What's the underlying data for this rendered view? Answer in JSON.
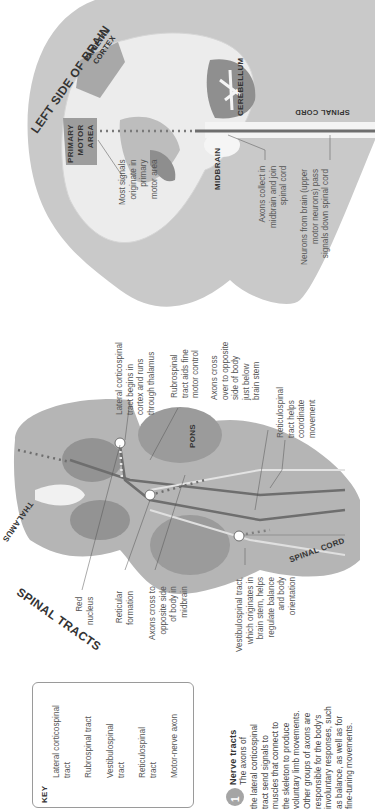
{
  "brain_view": {
    "title": "LEFT SIDE OF BRAIN",
    "regions": {
      "primary_motor_area": [
        "PRIMARY",
        "MOTOR",
        "AREA"
      ],
      "parietal_cortex": [
        "PARIETAL",
        "CORTEX"
      ],
      "cerebellum": "CEREBELLUM",
      "midbrain": "MIDBRAIN",
      "spinal_cord": "SPINAL CORD"
    },
    "annotations": {
      "most_signals": [
        "Most signals",
        "originate in",
        "primary",
        "motor area"
      ],
      "axons_collect": [
        "Axons collect in",
        "midbrain and join",
        "spinal cord"
      ],
      "neurons_from_brain": [
        "Neurons from brain (upper",
        "motor neurons) pass",
        "signals down spinal cord"
      ]
    }
  },
  "spinal_tracts_view": {
    "title": "SPINAL TRACTS",
    "regions": {
      "thalamus": "THALAMUS",
      "pons": "PONS",
      "spinal_cord": "SPINAL CORD"
    },
    "annotations": {
      "red_nucleus": [
        "Red",
        "nucleus"
      ],
      "reticular_formation": [
        "Reticular",
        "formation"
      ],
      "axons_cross_midbrain": [
        "Axons cross to",
        "opposite side",
        "of body in",
        "midbrain"
      ],
      "vestibulospinal": [
        "Vestibulospinal tract,",
        "which originates in",
        "brain stem, helps",
        "regulate balance",
        "and body",
        "orientation"
      ],
      "lateral_corticospinal": [
        "Lateral corticospinal",
        "tract begins in",
        "cortex and runs",
        "through thalamus"
      ],
      "rubrospinal": [
        "Rubrospinal",
        "tract aids fine",
        "motor control"
      ],
      "axons_cross_brainstem": [
        "Axons cross",
        "over to opposite",
        "side of body",
        "just below",
        "brain stem"
      ],
      "reticulospinal": [
        "Reticulospinal",
        "tract helps",
        "coordinate",
        "movement"
      ]
    }
  },
  "key": {
    "title": "KEY",
    "items": [
      {
        "label": [
          "Lateral corticospinal",
          "tract"
        ],
        "color": "#6e6e6e"
      },
      {
        "label": [
          "Rubrospinal tract"
        ],
        "color": "#e2e2e2"
      },
      {
        "label": [
          "Vestibulospinal",
          "tract"
        ],
        "color": "#a3a3a3"
      },
      {
        "label": [
          "Reticulospinal",
          "tract"
        ],
        "color": "#808080"
      },
      {
        "label": [
          "Motor-nerve axon"
        ],
        "color": "#3c3c3c"
      }
    ]
  },
  "caption": {
    "number": "1",
    "heading": "Nerve tracts",
    "lines": [
      "The axons of",
      "the lateral corticospinal",
      "tract send signals to",
      "muscles that connect to",
      "the skeleton to produce",
      "voluntary limb movements.",
      "Other groups of axons are",
      "responsible for the body's",
      "involuntary responses, such",
      "as balance, as well as for",
      "fine-tuning movements."
    ]
  },
  "colors": {
    "head_fill": "#c9c9c9",
    "brain_fill": "#ededed",
    "region_fill": "#9c9c9c",
    "tract_dark": "#6e6e6e",
    "brainstem_fill": "#b3b3b3"
  }
}
